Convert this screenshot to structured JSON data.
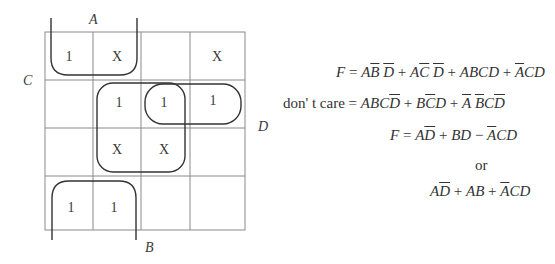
{
  "kmap": {
    "labels": {
      "A": "A",
      "B": "B",
      "C": "C",
      "D": "D"
    },
    "cells": [
      [
        "1",
        "X",
        "",
        "X"
      ],
      [
        "",
        "1",
        "1",
        "1"
      ],
      [
        "",
        "X",
        "X",
        ""
      ],
      [
        "1",
        "1",
        "",
        ""
      ]
    ],
    "groupings": [
      {
        "name": "top-left-pair-open-top",
        "cells": [
          [
            0,
            0
          ],
          [
            0,
            1
          ]
        ]
      },
      {
        "name": "bottom-left-pair-open-bottom",
        "cells": [
          [
            3,
            0
          ],
          [
            3,
            1
          ]
        ]
      },
      {
        "name": "center-quad",
        "cells": [
          [
            1,
            1
          ],
          [
            1,
            2
          ],
          [
            2,
            1
          ],
          [
            2,
            2
          ]
        ]
      },
      {
        "name": "row2-right-pair",
        "cells": [
          [
            1,
            2
          ],
          [
            1,
            3
          ]
        ]
      }
    ],
    "colors": {
      "grid": "#888888",
      "loop": "#333333",
      "text": "#3a3a3a"
    }
  },
  "equations": {
    "line1": {
      "lhs": "F",
      "eq": "=",
      "terms": [
        "AB̄D̄",
        "AC̄D̄",
        "ABCD",
        "ĀCD"
      ]
    },
    "line2": {
      "lhs": "don' t care",
      "eq": "=",
      "terms": [
        "ABCD̄",
        "BC̄D",
        "ĀB̄CD̄"
      ]
    },
    "line3": {
      "lhs": "F",
      "eq": "=",
      "expr": "AD̄ + BD − ĀCD"
    },
    "line4": {
      "text": "or"
    },
    "line5": {
      "expr": "AD̄ + AB + ĀCD"
    }
  },
  "text": {
    "dontcare": "don' t care",
    "or": "or",
    "F": "F"
  }
}
